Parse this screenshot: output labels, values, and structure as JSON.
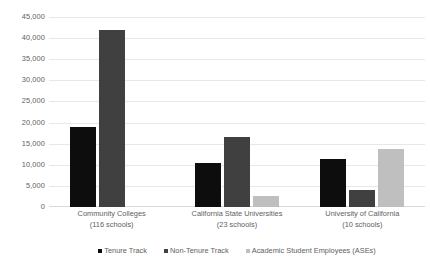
{
  "chart_data": {
    "type": "bar",
    "title": "",
    "xlabel": "",
    "ylabel": "",
    "ylim": [
      0,
      45000
    ],
    "ytick_step": 5000,
    "grid": true,
    "legend_position": "bottom",
    "categories": [
      "Community Colleges",
      "California State Universities",
      "University of California"
    ],
    "category_sublabels": [
      "(116 schools)",
      "(23 schools)",
      "(10 schools)"
    ],
    "ytick_labels": [
      "45,000",
      "40,000",
      "35,000",
      "30,000",
      "25,000",
      "20,000",
      "15,000",
      "10,000",
      "5,000",
      "0"
    ],
    "ytick_values": [
      45000,
      40000,
      35000,
      30000,
      25000,
      20000,
      15000,
      10000,
      5000,
      0
    ],
    "series": [
      {
        "name": "Tenure Track",
        "color": "#0d0d0d",
        "values": [
          19000,
          10400,
          11300
        ]
      },
      {
        "name": "Non-Tenure Track",
        "color": "#404040",
        "values": [
          42000,
          16600,
          4000
        ]
      },
      {
        "name": "Academic Student Employees (ASEs)",
        "color": "#bfbfbf",
        "values": [
          0,
          2600,
          13800
        ]
      }
    ]
  }
}
